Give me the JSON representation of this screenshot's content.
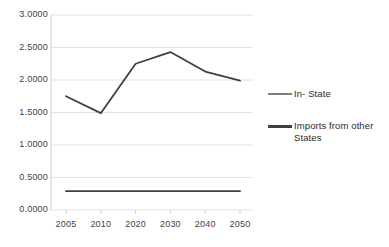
{
  "chart_data": {
    "type": "line",
    "title": "",
    "xlabel": "",
    "ylabel": "",
    "categories": [
      "2005",
      "2010",
      "2020",
      "2030",
      "2040",
      "2050"
    ],
    "x": [
      2005,
      2010,
      2020,
      2030,
      2040,
      2050
    ],
    "ylim": [
      0.0,
      3.0
    ],
    "ytick_labels": [
      "0.0000",
      "0.5000",
      "1.0000",
      "1.5000",
      "2.0000",
      "2.5000",
      "3.0000"
    ],
    "ytick_values": [
      0.0,
      0.5,
      1.0,
      1.5,
      2.0,
      2.5,
      3.0
    ],
    "grid": "horizontal",
    "legend_position": "right",
    "series": [
      {
        "name": "In- State",
        "color": "#3f3f3f",
        "values": [
          1.75,
          1.49,
          2.25,
          2.43,
          2.13,
          1.99
        ]
      },
      {
        "name": "Imports from other States",
        "color": "#3f3f3f",
        "values": [
          0.29,
          0.29,
          0.29,
          0.29,
          0.29,
          0.29
        ]
      }
    ]
  },
  "legend": {
    "items": [
      {
        "label": "In- State"
      },
      {
        "label": "Imports from other States"
      }
    ]
  },
  "colors": {
    "line": "#3f3f3f",
    "gridline": "#e2e2e2",
    "axis": "#d0d0d0",
    "text": "#3f3f3f",
    "legend_swatch_in_state": "#7f7f7f",
    "legend_swatch_imports": "#3f3f3f"
  }
}
